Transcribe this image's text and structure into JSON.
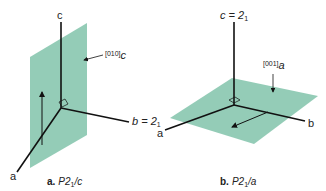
{
  "colors": {
    "plane": "#8ec9b3",
    "axis": "#111111",
    "text": "#222222"
  },
  "panel_a": {
    "caption_prefix": "a.",
    "caption_text": "P2",
    "caption_sub": "1",
    "caption_suffix": "/c",
    "axis_c": "c",
    "axis_a": "a",
    "axis_b": "b = 2",
    "axis_b_sub": "1",
    "glide_label": "[010]",
    "glide_sub": "c"
  },
  "panel_b": {
    "caption_prefix": "b.",
    "caption_text": "P2",
    "caption_sub": "1",
    "caption_suffix": "/a",
    "axis_c": "c = 2",
    "axis_c_sub": "1",
    "axis_a": "a",
    "axis_b": "b",
    "glide_label": "[001]",
    "glide_sub": "a"
  }
}
